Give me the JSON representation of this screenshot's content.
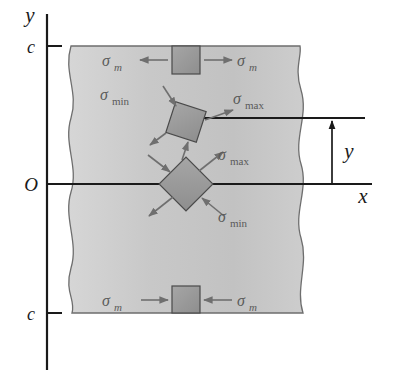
{
  "figure": {
    "colors": {
      "beam_fill": "#c9c9c9",
      "beam_edge": "#6e6e6e",
      "element_fill": "#9a9a9a",
      "element_edge": "#4a4a4a",
      "axis": "#1a1a1a",
      "arrow": "#6f6f6f",
      "label_text": "#5a5a5a"
    }
  },
  "axes": {
    "y_label": "y",
    "x_label": "x",
    "origin_label": "O",
    "tick_top_label": "c",
    "tick_bottom_label": "c"
  },
  "dimension": {
    "label": "y"
  },
  "elements": [
    {
      "id": "top-element",
      "position": "top-surface",
      "orientation_deg": 0,
      "shape": "square",
      "stress_state": "uniaxial-tension",
      "labels": [
        {
          "id": "top-left-label",
          "sigma": "σ",
          "subscript": "m",
          "side": "left",
          "arrow": "outward"
        },
        {
          "id": "top-right-label",
          "sigma": "σ",
          "subscript": "m",
          "side": "right",
          "arrow": "outward"
        }
      ]
    },
    {
      "id": "middle-element",
      "position": "between-top-and-neutral-axis",
      "orientation_deg": 18,
      "shape": "square-rotated",
      "stress_state": "biaxial-principal",
      "labels": [
        {
          "id": "mid-min-label",
          "sigma": "σ",
          "subscript": "min",
          "side": "upper-left",
          "arrow": "inward"
        },
        {
          "id": "mid-max-label",
          "sigma": "σ",
          "subscript": "max",
          "side": "upper-right",
          "arrow": "outward"
        }
      ]
    },
    {
      "id": "neutral-axis-element",
      "position": "neutral-axis",
      "orientation_deg": 45,
      "shape": "diamond",
      "stress_state": "pure-shear-principal",
      "labels": [
        {
          "id": "na-max-label",
          "sigma": "σ",
          "subscript": "max",
          "side": "upper-right",
          "arrow": "outward"
        },
        {
          "id": "na-min-label",
          "sigma": "σ",
          "subscript": "min",
          "side": "lower-right",
          "arrow": "inward"
        }
      ]
    },
    {
      "id": "bottom-element",
      "position": "bottom-surface",
      "orientation_deg": 0,
      "shape": "square",
      "stress_state": "uniaxial-compression",
      "labels": [
        {
          "id": "bot-left-label",
          "sigma": "σ",
          "subscript": "m",
          "side": "left",
          "arrow": "inward"
        },
        {
          "id": "bot-right-label",
          "sigma": "σ",
          "subscript": "m",
          "side": "right",
          "arrow": "inward"
        }
      ]
    }
  ]
}
